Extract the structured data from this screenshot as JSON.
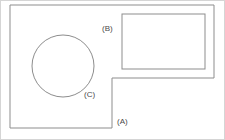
{
  "diagram": {
    "background_color": "#ffffff",
    "frame_color": "#d5d5d5",
    "line_color": "#8d8d8d",
    "label_color": "#4a4a4a",
    "labels": {
      "a": "(A)",
      "b": "(B)",
      "c": "(C)"
    },
    "shapes": {
      "outer_polygon": {
        "name": "L-shaped outer boundary",
        "label": "(A)",
        "points": "10,5 214,5 214,78 112,78 112,128 10,128"
      },
      "inner_rectangle": {
        "name": "Inner rectangle",
        "label": "(B)",
        "x": 122,
        "y": 14,
        "width": 83,
        "height": 55
      },
      "circle": {
        "name": "Circle",
        "label": "(C)",
        "cx": 63,
        "cy": 66,
        "r": 31
      }
    }
  }
}
